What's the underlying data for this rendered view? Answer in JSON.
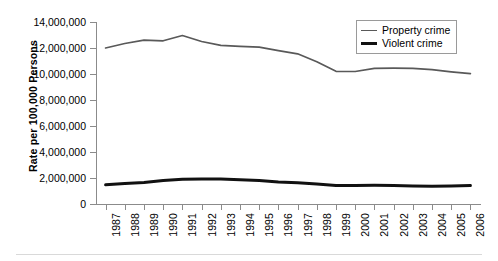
{
  "chart_data": {
    "type": "line",
    "title": "",
    "xlabel": "",
    "ylabel": "Rate per 100,000 Persons",
    "categories": [
      "1987",
      "1988",
      "1989",
      "1990",
      "1991",
      "1992",
      "1993",
      "1994",
      "1995",
      "1996",
      "1997",
      "1998",
      "1999",
      "2000",
      "2001",
      "2002",
      "2003",
      "2004",
      "2005",
      "2006"
    ],
    "series": [
      {
        "name": "Property crime",
        "values": [
          12000000,
          12350000,
          12600000,
          12550000,
          12960000,
          12500000,
          12200000,
          12130000,
          12060000,
          11800000,
          11550000,
          10950000,
          10210000,
          10190000,
          10440000,
          10450000,
          10440000,
          10330000,
          10170000,
          10020000
        ]
      },
      {
        "name": "Violent crime",
        "values": [
          1480000,
          1570000,
          1650000,
          1800000,
          1910000,
          1930000,
          1930000,
          1860000,
          1800000,
          1690000,
          1630000,
          1530000,
          1430000,
          1420000,
          1440000,
          1420000,
          1380000,
          1360000,
          1390000,
          1420000
        ]
      }
    ],
    "ylim": [
      0,
      14000000
    ],
    "ytick_labels": [
      "0",
      "2,000,000",
      "4,000,000",
      "6,000,000",
      "8,000,000",
      "10,000,000",
      "12,000,000",
      "14,000,000"
    ],
    "ytick_values": [
      0,
      2000000,
      4000000,
      6000000,
      8000000,
      10000000,
      12000000,
      14000000
    ],
    "grid": false,
    "legend_position": "top-right",
    "legend_entries": [
      "Property crime",
      "Violent crime"
    ],
    "colors": {
      "property_crime": "#595959",
      "violent_crime": "#111111",
      "axis": "#8b8b8b",
      "background": "#ffffff"
    }
  }
}
